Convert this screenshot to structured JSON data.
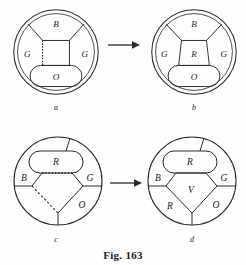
{
  "figure": {
    "caption": "Fig. 163",
    "id": "fig-163",
    "ink_color": "#2a2a2a",
    "background_color": "#fefefe"
  },
  "panels": [
    {
      "key": "a",
      "sublabel": "a",
      "arrow_after": true,
      "regions": [
        {
          "name": "B",
          "label": "B",
          "x": 50,
          "y": 24
        },
        {
          "name": "G-left",
          "label": "G",
          "x": 22,
          "y": 52
        },
        {
          "name": "G-right",
          "label": "G",
          "x": 78,
          "y": 52
        },
        {
          "name": "O",
          "label": "O",
          "x": 50,
          "y": 76
        },
        {
          "name": "center-empty",
          "label": "",
          "x": 50,
          "y": 51
        }
      ]
    },
    {
      "key": "b",
      "sublabel": "b",
      "arrow_after": false,
      "regions": [
        {
          "name": "B",
          "label": "B",
          "x": 50,
          "y": 24
        },
        {
          "name": "G-left",
          "label": "G",
          "x": 22,
          "y": 52
        },
        {
          "name": "G-right",
          "label": "G",
          "x": 78,
          "y": 52
        },
        {
          "name": "O",
          "label": "O",
          "x": 50,
          "y": 76
        },
        {
          "name": "center-R",
          "label": "R",
          "x": 50,
          "y": 51
        }
      ]
    },
    {
      "key": "c",
      "sublabel": "c",
      "arrow_after": true,
      "regions": [
        {
          "name": "R",
          "label": "R",
          "x": 50,
          "y": 30
        },
        {
          "name": "B",
          "label": "B",
          "x": 20,
          "y": 47
        },
        {
          "name": "G",
          "label": "G",
          "x": 79,
          "y": 47
        },
        {
          "name": "O",
          "label": "O",
          "x": 72,
          "y": 74
        },
        {
          "name": "center-empty",
          "label": "",
          "x": 50,
          "y": 58
        },
        {
          "name": "bottom-left-empty",
          "label": "",
          "x": 30,
          "y": 76
        }
      ]
    },
    {
      "key": "d",
      "sublabel": "d",
      "arrow_after": false,
      "regions": [
        {
          "name": "R-top",
          "label": "R",
          "x": 50,
          "y": 30
        },
        {
          "name": "B",
          "label": "B",
          "x": 20,
          "y": 47
        },
        {
          "name": "G",
          "label": "G",
          "x": 79,
          "y": 47
        },
        {
          "name": "V",
          "label": "V",
          "x": 50,
          "y": 58
        },
        {
          "name": "R-bottom",
          "label": "R",
          "x": 30,
          "y": 76
        },
        {
          "name": "O",
          "label": "O",
          "x": 72,
          "y": 74
        }
      ]
    }
  ],
  "arrows": [
    {
      "name": "arrow-a-to-b",
      "direction": "right"
    },
    {
      "name": "arrow-c-to-d",
      "direction": "right"
    }
  ]
}
